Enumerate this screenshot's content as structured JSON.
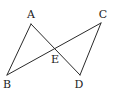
{
  "diagram": {
    "type": "geometry",
    "points": {
      "A": {
        "label": "A",
        "x": 31,
        "y": 24,
        "lx": 31,
        "ly": 18
      },
      "B": {
        "label": "B",
        "x": 7,
        "y": 75,
        "lx": 7,
        "ly": 88
      },
      "C": {
        "label": "C",
        "x": 101,
        "y": 23,
        "lx": 103,
        "ly": 18
      },
      "D": {
        "label": "D",
        "x": 80,
        "y": 75,
        "lx": 79,
        "ly": 88
      },
      "E": {
        "label": "E",
        "x": 55,
        "y": 50,
        "lx": 55,
        "ly": 63
      }
    },
    "segments": [
      {
        "from": "A",
        "to": "B"
      },
      {
        "from": "A",
        "to": "D"
      },
      {
        "from": "B",
        "to": "C"
      },
      {
        "from": "C",
        "to": "D"
      }
    ],
    "intersection": {
      "point": "E",
      "of": [
        "AD",
        "BC"
      ]
    },
    "colors": {
      "line": "#2a2a2a",
      "text": "#222222",
      "background": "#ffffff"
    }
  }
}
